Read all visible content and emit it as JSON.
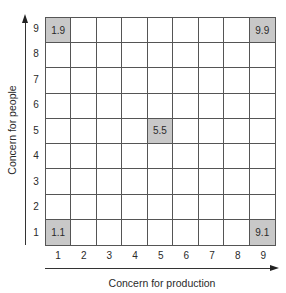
{
  "diagram": {
    "x_axis_label": "Concern for production",
    "y_axis_label": "Concern for people",
    "x_ticks": [
      "1",
      "2",
      "3",
      "4",
      "5",
      "6",
      "7",
      "8",
      "9"
    ],
    "y_ticks": [
      "9",
      "8",
      "7",
      "6",
      "5",
      "4",
      "3",
      "2",
      "1"
    ],
    "shaded_color": "#c8c8c8",
    "highlighted_cells": [
      {
        "label": "1.9",
        "x": 1,
        "y": 9
      },
      {
        "label": "9.9",
        "x": 9,
        "y": 9
      },
      {
        "label": "5.5",
        "x": 5,
        "y": 5
      },
      {
        "label": "1.1",
        "x": 1,
        "y": 1
      },
      {
        "label": "9.1",
        "x": 9,
        "y": 1
      }
    ]
  }
}
